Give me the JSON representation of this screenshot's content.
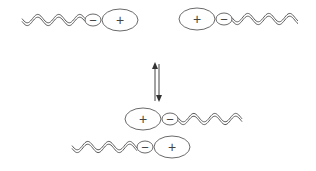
{
  "diagram": {
    "title": "",
    "colors": {
      "stroke": "#5a5a5a",
      "text": "#444444",
      "background": "#ffffff"
    },
    "molecules": [
      {
        "id": "top-left",
        "orientation": "tail-left",
        "tail": {
          "x1": 22,
          "x2": 85,
          "y": 20
        },
        "minus": {
          "cx": 93,
          "cy": 20,
          "rx": 8,
          "ry": 6,
          "label": "−"
        },
        "plus": {
          "cx": 120,
          "cy": 20,
          "rx": 18,
          "ry": 11,
          "label": "+"
        }
      },
      {
        "id": "top-right",
        "orientation": "tail-right",
        "plus": {
          "cx": 197,
          "cy": 19,
          "rx": 18,
          "ry": 11,
          "label": "+"
        },
        "minus": {
          "cx": 224,
          "cy": 19,
          "rx": 8,
          "ry": 6,
          "label": "−"
        },
        "tail": {
          "x1": 232,
          "x2": 298,
          "y": 19
        }
      },
      {
        "id": "pair-top",
        "orientation": "tail-right",
        "plus": {
          "cx": 143,
          "cy": 119,
          "rx": 18,
          "ry": 11,
          "label": "+"
        },
        "minus": {
          "cx": 170,
          "cy": 119,
          "rx": 8,
          "ry": 6,
          "label": "−"
        },
        "tail": {
          "x1": 178,
          "x2": 242,
          "y": 119
        }
      },
      {
        "id": "pair-bottom",
        "orientation": "tail-left",
        "tail": {
          "x1": 72,
          "x2": 137,
          "y": 147
        },
        "minus": {
          "cx": 145,
          "cy": 147,
          "rx": 8,
          "ry": 6,
          "label": "−"
        },
        "plus": {
          "cx": 172,
          "cy": 147,
          "rx": 18,
          "ry": 11,
          "label": "+"
        }
      }
    ],
    "equilibrium_arrow": {
      "type": "reversible",
      "up": {
        "x": 155,
        "y1": 101,
        "y2": 62
      },
      "down": {
        "x": 159,
        "y1": 64,
        "y2": 102
      }
    },
    "labels": {
      "plus": "+",
      "minus": "−"
    }
  }
}
